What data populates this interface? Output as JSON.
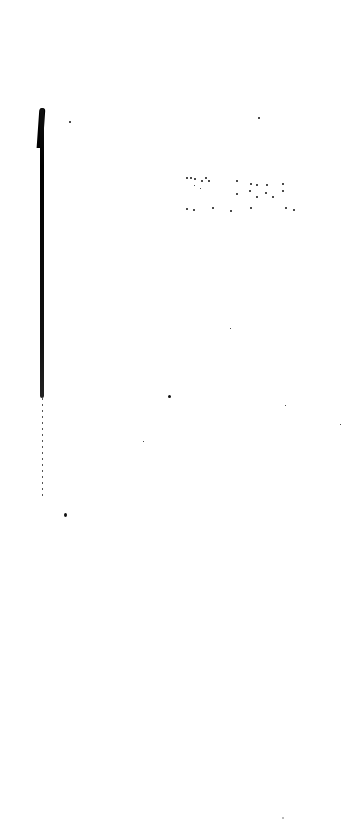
{
  "page": {
    "type": "scanned-blank-page",
    "faint_text_lines": [
      "",
      ""
    ],
    "background_color": "#ffffff",
    "ink_color": "#000000"
  }
}
